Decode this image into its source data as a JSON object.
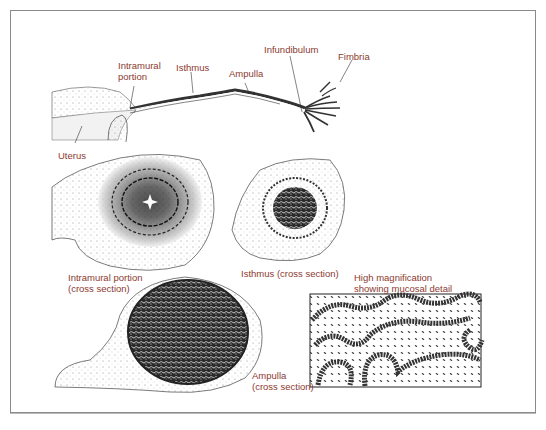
{
  "figure": {
    "colors": {
      "label": "#8b3a2f",
      "frame": "#8a8a8a",
      "ink": "#222222"
    },
    "top_labels": [
      {
        "id": "intramural",
        "lines": [
          "Intramural",
          "portion"
        ]
      },
      {
        "id": "isthmus",
        "lines": [
          "Isthmus"
        ]
      },
      {
        "id": "ampulla",
        "lines": [
          "Ampulla"
        ]
      },
      {
        "id": "infundibulum",
        "lines": [
          "Infundibulum"
        ]
      },
      {
        "id": "fimbria",
        "lines": [
          "Fimbria"
        ]
      },
      {
        "id": "uterus",
        "lines": [
          "Uterus"
        ]
      }
    ],
    "section_labels": [
      {
        "id": "intramural-cs",
        "lines": [
          "Intramural portion",
          "(cross section)"
        ]
      },
      {
        "id": "isthmus-cs",
        "lines": [
          "Isthmus (cross section)"
        ]
      },
      {
        "id": "high-mag",
        "lines": [
          "High magnification",
          "showing mucosal detail"
        ]
      },
      {
        "id": "ampulla-cs",
        "lines": [
          "Ampulla",
          "(cross section)"
        ]
      }
    ]
  }
}
